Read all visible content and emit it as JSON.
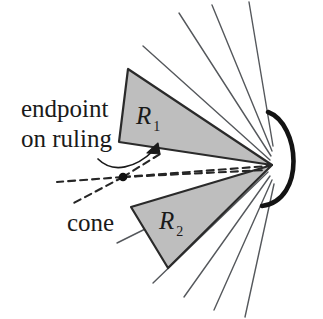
{
  "figure": {
    "background_color": "#ffffff",
    "ink_color": "#1a1a1a",
    "region_fill_color": "#bebebe",
    "region_stroke_color": "#2a2a2a",
    "ruling_color": "#55585c",
    "dashed_color": "#262626",
    "labels": {
      "endpoint_line1": "endpoint",
      "endpoint_line2": "on ruling",
      "cone": "cone",
      "region_1_base": "R",
      "region_1_sub": "1",
      "region_2_base": "R",
      "region_2_sub": "2"
    },
    "icons": {
      "leader_arrow": "arrow-up-right-icon",
      "endpoint_dot": "filled-dot-icon"
    },
    "geometry": {
      "apex": [
        272,
        165
      ],
      "region_1_vertices": [
        [
          128,
          69
        ],
        [
          119,
          142
        ],
        [
          272,
          165
        ]
      ],
      "region_2_vertices": [
        [
          131,
          207
        ],
        [
          168,
          268
        ],
        [
          272,
          165
        ]
      ],
      "endpoint_dot": [
        123,
        177
      ],
      "arc_start": [
        268,
        112
      ],
      "arc_end": [
        262,
        206
      ],
      "arc_bulge_x": 312,
      "ruling_count_upper": 4,
      "ruling_count_lower": 4,
      "cone_dash_rays": 3
    }
  }
}
